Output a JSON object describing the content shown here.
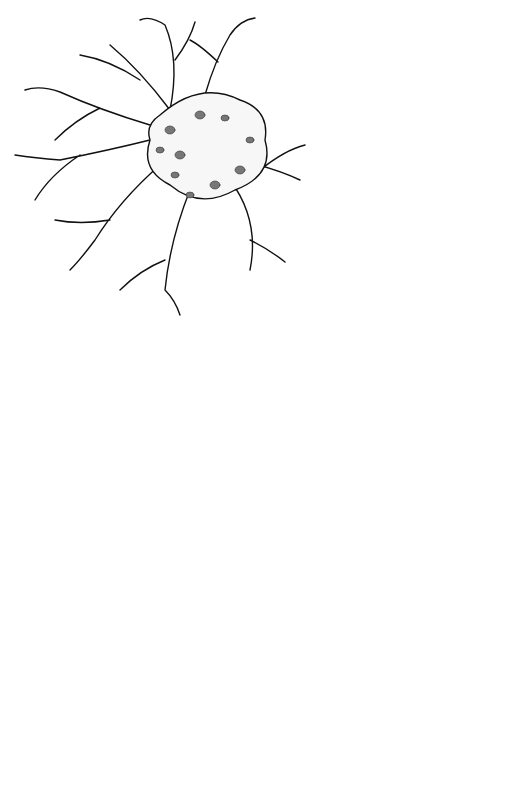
{
  "diagram": {
    "labels": {
      "nissl_body": "Nissl body",
      "axon_hillock": "Axon hillock",
      "axon_top": "Axon",
      "neurofibril": "Neurofibril",
      "nucleolar_satellite": "Nucleolar satellite",
      "dendrite": "Dendrite",
      "cell_body": "Cell body",
      "nucleus": "Nucleus",
      "nucleolus": "Nucleolus",
      "axon_mid": "Axon",
      "interruption": "Interruption to imply greater length of axon",
      "neurolemma": "Neurolemma or sheath of Schwann",
      "schwann_nucleus": "Schwann cell nucleus",
      "myelin": "Myelin in Schwann cell",
      "node_ranvier": "Node of Ranvier",
      "skeletal_muscle": "Skeletal muscle",
      "myoneural_junction": "Myoneural junction"
    },
    "colors": {
      "ink": "#111111",
      "background": "#ffffff",
      "shading": "#777777"
    }
  }
}
